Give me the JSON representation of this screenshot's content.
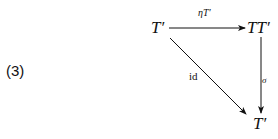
{
  "equation_number": "(3)",
  "nodes": {
    "top_left": "T′",
    "top_right": "TT′",
    "bottom_right": "T′"
  },
  "arrows": {
    "top": {
      "from": "T′",
      "to": "TT′",
      "label": "ηT′"
    },
    "diagonal": {
      "from": "T′",
      "to": "T′",
      "label": "id"
    },
    "right": {
      "from": "TT′",
      "to": "T′",
      "label": "σ"
    }
  }
}
